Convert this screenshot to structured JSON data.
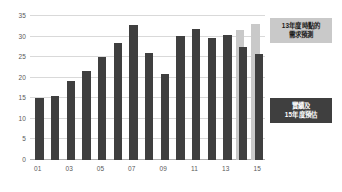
{
  "chart_data": {
    "type": "bar",
    "title": "",
    "subtitle": "",
    "xlabel": "",
    "ylabel": "",
    "categories": [
      "01",
      "02",
      "03",
      "04",
      "05",
      "06",
      "07",
      "08",
      "09",
      "10",
      "11",
      "12",
      "13",
      "14",
      "15"
    ],
    "xtick_labels": [
      "01",
      "03",
      "05",
      "07",
      "09",
      "11",
      "13",
      "15"
    ],
    "xtick_indices": [
      0,
      2,
      4,
      6,
      8,
      10,
      12,
      14
    ],
    "ylim": [
      0,
      35
    ],
    "yticks": [
      0,
      5,
      10,
      15,
      20,
      25,
      30,
      35
    ],
    "ytick_labels": [
      "0",
      "5",
      "10",
      "15",
      "20",
      "25",
      "30",
      "35"
    ],
    "grid": true,
    "legend_position": "right",
    "series": [
      {
        "name": "實績及15年度預估",
        "color": "#3f3f3f",
        "values": [
          15.0,
          15.6,
          19.2,
          21.7,
          25.0,
          28.4,
          32.8,
          26.0,
          21.0,
          30.2,
          31.9,
          29.7,
          30.5,
          27.5,
          25.7
        ]
      },
      {
        "name": "13年度時點的需求預測",
        "color": "#c9c9c9",
        "values": [
          null,
          null,
          null,
          null,
          null,
          null,
          null,
          null,
          null,
          null,
          null,
          null,
          null,
          31.5,
          33.0
        ]
      }
    ]
  },
  "callouts": {
    "forecast": {
      "line1": "13年度時點的",
      "line2": "需求預測",
      "bg": "#c9c9c9",
      "fg": "#1a1a1a"
    },
    "actual": {
      "line1": "實績及",
      "line2": "15年度預估",
      "bg": "#3f3f3f",
      "fg": "#ffffff"
    }
  }
}
